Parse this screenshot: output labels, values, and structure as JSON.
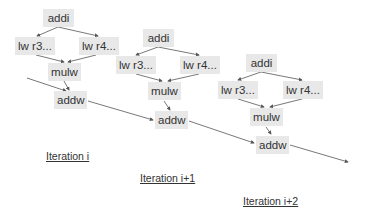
{
  "diagram": {
    "iterations": [
      {
        "label": "Iteration i",
        "nodes": {
          "addi": "addi",
          "lw_r3": "lw r3...",
          "lw_r4": "lw r4...",
          "mulw": "mulw",
          "addw": "addw"
        }
      },
      {
        "label": "Iteration i+1",
        "nodes": {
          "addi": "addi",
          "lw_r3": "lw r3...",
          "lw_r4": "lw r4...",
          "mulw": "mulw",
          "addw": "addw"
        }
      },
      {
        "label": "Iteration i+2",
        "nodes": {
          "addi": "addi",
          "lw_r3": "lw r3...",
          "lw_r4": "lw r4...",
          "mulw": "mulw",
          "addw": "addw"
        }
      }
    ],
    "edges": [
      "addi->lw r3...",
      "addi->lw r4...",
      "lw r3...->mulw",
      "lw r4...->mulw",
      "mulw->addw",
      "addw(i-1)->addw(i)",
      "addw(i)->addw(i+1)",
      "addw(i+1)->addw(i+2)",
      "addw(i+2)->next"
    ],
    "colors": {
      "node_bg": "#e8e8e8",
      "text": "#333333",
      "edge": "#555555"
    }
  }
}
